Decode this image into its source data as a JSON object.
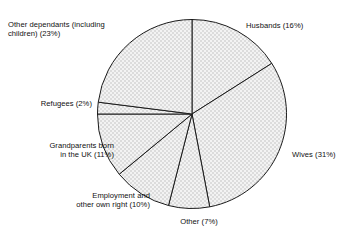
{
  "chart_data": {
    "type": "pie",
    "title": "",
    "subtitle": "",
    "xlabel": "",
    "ylabel": "",
    "legend_position": "outside-labels",
    "grid": false,
    "units": "percent",
    "start_angle_deg": 0,
    "direction": "clockwise",
    "categories": [
      "Husbands",
      "Wives",
      "Other",
      "Employment and other own right",
      "Grandparents born in the UK",
      "Refugees",
      "Other dependants (including children)"
    ],
    "values": [
      16,
      31,
      7,
      10,
      11,
      2,
      23
    ],
    "slices": [
      {
        "label": "Husbands",
        "value": 16,
        "text": "Husbands (16%)",
        "start_deg": 0,
        "end_deg": 57.6
      },
      {
        "label": "Wives",
        "value": 31,
        "text": "Wives (31%)",
        "start_deg": 57.6,
        "end_deg": 169.2
      },
      {
        "label": "Other",
        "value": 7,
        "text": "Other (7%)",
        "start_deg": 169.2,
        "end_deg": 194.4
      },
      {
        "label": "Employment and other own right",
        "value": 10,
        "text": "Employment and\nother own right (10%)",
        "start_deg": 194.4,
        "end_deg": 230.4
      },
      {
        "label": "Grandparents born in the UK",
        "value": 11,
        "text": "Grandparents born\nin the UK (11%)",
        "start_deg": 230.4,
        "end_deg": 270.0
      },
      {
        "label": "Refugees",
        "value": 2,
        "text": "Refugees (2%)",
        "start_deg": 270.0,
        "end_deg": 277.2
      },
      {
        "label": "Other dependants (including children)",
        "value": 23,
        "text": "Other dependants (including\nchildren) (23%)",
        "start_deg": 277.2,
        "end_deg": 360.0
      }
    ],
    "colors": {
      "slice_fill": "#e8e8e8",
      "slice_stroke": "#1b1b1b",
      "background": "#ffffff",
      "text": "#101010"
    }
  },
  "labels": {
    "husbands": "Husbands (16%)",
    "wives": "Wives (31%)",
    "other": "Other (7%)",
    "employment": "Employment and\nother own right (10%)",
    "grandparents": "Grandparents born\nin the UK (11%)",
    "refugees": "Refugees (2%)",
    "other_dependants": "Other dependants (including\nchildren) (23%)"
  }
}
